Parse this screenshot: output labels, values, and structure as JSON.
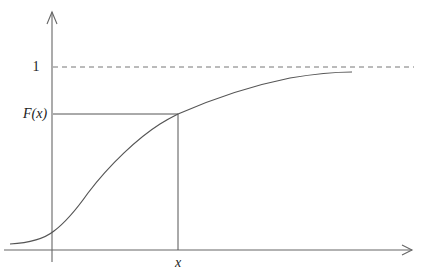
{
  "diagram": {
    "y_labels": {
      "one": "1",
      "fx": "F(x)"
    },
    "x_labels": {
      "x": "x"
    },
    "asymptote_value": 1,
    "marked_point": {
      "x_label": "x",
      "y_label": "F(x)"
    }
  }
}
